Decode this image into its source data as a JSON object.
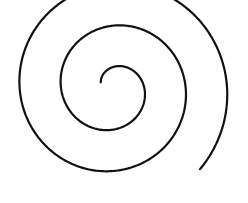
{
  "image": {
    "title": "Spiral Line Drawing",
    "kind": "line-art",
    "width": 248,
    "height": 203,
    "background_color": "#ffffff"
  },
  "figure": {
    "name": "archimedean-spiral",
    "stroke_color": "#111111",
    "stroke_width": 2.2,
    "fill": "none",
    "winding_direction": "counterclockwise-inward",
    "turns": 2.55,
    "center": {
      "x": 113,
      "y": 88
    },
    "inner_radius": 13.5,
    "outer_radius": 119,
    "inner_end_point": {
      "x": 100.2,
      "y": 82.1
    },
    "outer_end_point": {
      "x": 228.0,
      "y": 126.5
    },
    "start_angle_deg": 155,
    "end_angle_deg": -763,
    "bounds": {
      "left": 30,
      "top": 12,
      "right": 228,
      "bottom": 186
    },
    "extrema": {
      "topmost": {
        "x": 118,
        "y": 12
      },
      "leftmost": {
        "x": 30,
        "y": 92
      },
      "bottommost": {
        "x": 120,
        "y": 186
      },
      "rightmost": {
        "x": 197,
        "y": 76
      }
    },
    "crossing_samples_at_y88": {
      "left_outer_x": 30,
      "left_middle_x": 76,
      "left_inner_x": 100,
      "right_inner_x": 128,
      "right_middle_x": 155,
      "right_outer_x": 197
    }
  }
}
